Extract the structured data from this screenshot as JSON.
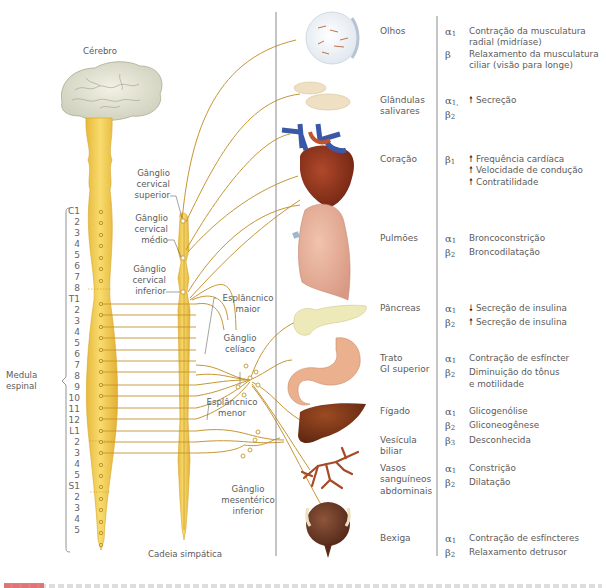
{
  "figure": {
    "left_labels": {
      "brain": "Cérebro",
      "spinal_cord": [
        "Medula",
        "espinal"
      ],
      "sympathetic_chain": "Cadeia simpática"
    },
    "ganglia": {
      "superior_cervical": [
        "Gânglio",
        "cervical",
        "superior"
      ],
      "middle_cervical": [
        "Gânglio",
        "cervical",
        "médio"
      ],
      "inferior_cervical": [
        "Gânglio",
        "cervical",
        "inferior"
      ],
      "greater_splanchnic": [
        "Esplâncnico",
        "maior"
      ],
      "celiac": [
        "Gânglio",
        "celíaco"
      ],
      "lesser_splanchnic": [
        "Esplâncnico",
        "menor"
      ],
      "inferior_mesenteric": [
        "Gânglio",
        "mesentérico",
        "inferior"
      ]
    },
    "spinal_segments": [
      "C1",
      "2",
      "3",
      "4",
      "5",
      "6",
      "7",
      "8",
      "T1",
      "2",
      "3",
      "4",
      "5",
      "6",
      "7",
      "8",
      "9",
      "10",
      "11",
      "12",
      "L1",
      "2",
      "3",
      "4",
      "5",
      "S1",
      "2",
      "3",
      "4",
      "5"
    ],
    "organs": [
      {
        "name": [
          "Olhos"
        ],
        "receptors": [
          {
            "sym": "α",
            "sub": "1",
            "effect": [
              "Contração da musculatura",
              "radial (midríase)"
            ],
            "arrow": ""
          },
          {
            "sym": "β",
            "sub": "",
            "effect": [
              "Relaxamento da musculatura",
              "ciliar (visão para longe)"
            ],
            "arrow": ""
          }
        ]
      },
      {
        "name": [
          "Glândulas",
          "salivares"
        ],
        "receptors": [
          {
            "sym": "α",
            "sub": "1,",
            "effect": [
              "Secreção"
            ],
            "arrow": "up"
          },
          {
            "sym": "β",
            "sub": "2",
            "effect": [],
            "arrow": ""
          }
        ]
      },
      {
        "name": [
          "Coração"
        ],
        "receptors": [
          {
            "sym": "β",
            "sub": "1",
            "effect": [
              "Frequência cardíaca",
              "Velocidade de condução",
              "Contratilidade"
            ],
            "arrow": "up-each"
          }
        ]
      },
      {
        "name": [
          "Pulmões"
        ],
        "receptors": [
          {
            "sym": "α",
            "sub": "1",
            "effect": [
              "Broncoconstrição"
            ],
            "arrow": ""
          },
          {
            "sym": "β",
            "sub": "2",
            "effect": [
              "Broncodilatação"
            ],
            "arrow": ""
          }
        ]
      },
      {
        "name": [
          "Pâncreas"
        ],
        "receptors": [
          {
            "sym": "α",
            "sub": "1",
            "effect": [
              "Secreção de insulina"
            ],
            "arrow": "down"
          },
          {
            "sym": "β",
            "sub": "2",
            "effect": [
              "Secreção de insulina"
            ],
            "arrow": "up"
          }
        ]
      },
      {
        "name": [
          "Trato",
          "GI superior"
        ],
        "receptors": [
          {
            "sym": "α",
            "sub": "1",
            "effect": [
              "Contração de esfíncter"
            ],
            "arrow": ""
          },
          {
            "sym": "β",
            "sub": "2",
            "effect": [
              "Diminuição do tônus",
              "e motilidade"
            ],
            "arrow": ""
          }
        ]
      },
      {
        "name": [
          "Fígado"
        ],
        "receptors": [
          {
            "sym": "α",
            "sub": "1",
            "effect": [
              "Glicogenólise"
            ],
            "arrow": ""
          },
          {
            "sym": "β",
            "sub": "2",
            "effect": [
              "Gliconeogênese"
            ],
            "arrow": ""
          }
        ]
      },
      {
        "name": [
          "Vesícula",
          "biliar"
        ],
        "receptors": [
          {
            "sym": "β",
            "sub": "3",
            "effect": [
              "Desconhecida"
            ],
            "arrow": ""
          }
        ]
      },
      {
        "name": [
          "Vasos",
          "sanguíneos",
          "abdominais"
        ],
        "receptors": [
          {
            "sym": "α",
            "sub": "1",
            "effect": [
              "Constrição"
            ],
            "arrow": ""
          },
          {
            "sym": "β",
            "sub": "2",
            "effect": [
              "Dilatação"
            ],
            "arrow": ""
          }
        ]
      },
      {
        "name": [
          "Bexiga"
        ],
        "receptors": [
          {
            "sym": "α",
            "sub": "1",
            "effect": [
              "Contração de esfíncteres"
            ],
            "arrow": ""
          },
          {
            "sym": "β",
            "sub": "2",
            "effect": [
              "Relaxamento detrusor"
            ],
            "arrow": ""
          }
        ]
      }
    ],
    "arrows": {
      "up": "🠕",
      "down": "🠗"
    },
    "colors": {
      "nerve": "#c89a3a",
      "spinal_cord": "#f2cf5a",
      "spinal_cord_edge": "#d9ad2e",
      "divider": "#8a8a8a",
      "caption_accent": "#e05a5a"
    }
  }
}
